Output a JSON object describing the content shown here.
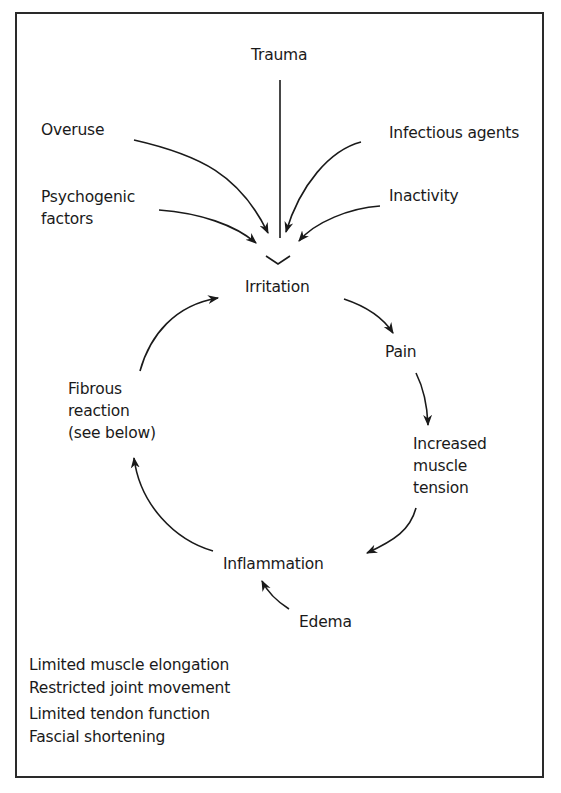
{
  "diagram": {
    "type": "cycle-flow",
    "causes": {
      "trauma": "Trauma",
      "overuse": "Overuse",
      "infectious_agents": "Infectious agents",
      "psychogenic_factors": [
        "Psychogenic",
        "factors"
      ],
      "inactivity": "Inactivity"
    },
    "cycle": {
      "irritation": "Irritation",
      "pain": "Pain",
      "increased_muscle_tension": [
        "Increased",
        "muscle",
        "tension"
      ],
      "inflammation": "Inflammation",
      "edema": "Edema",
      "fibrous_reaction": [
        "Fibrous",
        "reaction",
        "(see below)"
      ]
    },
    "consequences": [
      "Limited muscle elongation",
      "Restricted joint movement",
      "Limited tendon function",
      "Fascial shortening"
    ],
    "colors": {
      "line": "#1a1a1a",
      "border": "#2a2a2a",
      "background": "#ffffff"
    }
  }
}
